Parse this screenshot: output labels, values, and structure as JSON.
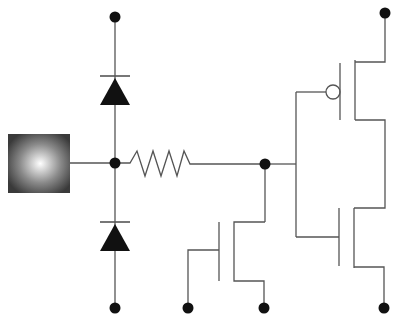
{
  "diagram": {
    "type": "circuit-schematic",
    "colors": {
      "wire": "#555555",
      "node": "#111111",
      "background": "#ffffff"
    },
    "components": [
      {
        "id": "pad",
        "kind": "input-pad",
        "label": "Input pad"
      },
      {
        "id": "d1",
        "kind": "diode",
        "label": "Upper clamp diode"
      },
      {
        "id": "d2",
        "kind": "diode",
        "label": "Lower clamp diode"
      },
      {
        "id": "r1",
        "kind": "resistor",
        "label": "Series resistor"
      },
      {
        "id": "m1",
        "kind": "nmos",
        "label": "Grounded-gate NMOS"
      },
      {
        "id": "mp",
        "kind": "pmos",
        "label": "Inverter PMOS"
      },
      {
        "id": "mn",
        "kind": "nmos",
        "label": "Inverter NMOS"
      }
    ],
    "terminals": {
      "top_left": "VDD terminal (diode)",
      "top_right": "VDD terminal (PMOS)",
      "bottom": [
        "GND terminal (diode)",
        "GND terminal (gate)",
        "GND terminal (NMOS source)",
        "GND terminal (inverter NMOS)"
      ]
    }
  }
}
